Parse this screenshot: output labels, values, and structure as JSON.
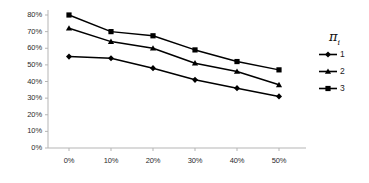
{
  "chart_data": {
    "type": "line",
    "title": "",
    "xlabel": "",
    "ylabel": "",
    "categories": [
      "0%",
      "10%",
      "20%",
      "30%",
      "40%",
      "50%"
    ],
    "x": [
      0,
      10,
      20,
      30,
      40,
      50
    ],
    "series": [
      {
        "name": "1",
        "marker": "diamond",
        "values": [
          55,
          54,
          48,
          41,
          36,
          31
        ]
      },
      {
        "name": "2",
        "marker": "triangle",
        "values": [
          72,
          64,
          60,
          51,
          46,
          38
        ]
      },
      {
        "name": "3",
        "marker": "square",
        "values": [
          80,
          70,
          67.5,
          59,
          52,
          47
        ]
      }
    ],
    "ylim": [
      0,
      80
    ],
    "xlim": [
      -5,
      55
    ],
    "ytick_labels": [
      "0%",
      "10%",
      "20%",
      "30%",
      "40%",
      "50%",
      "60%",
      "70%",
      "80%"
    ],
    "ytick_values": [
      0,
      10,
      20,
      30,
      40,
      50,
      60,
      70,
      80
    ],
    "xtick_labels": [
      "0%",
      "10%",
      "20%",
      "30%",
      "40%",
      "50%"
    ],
    "grid": false,
    "legend_position": "right",
    "legend_title": "π",
    "legend_title_subscript": "i",
    "series_color": "#000000",
    "axis_color": "#b5b5b5"
  }
}
